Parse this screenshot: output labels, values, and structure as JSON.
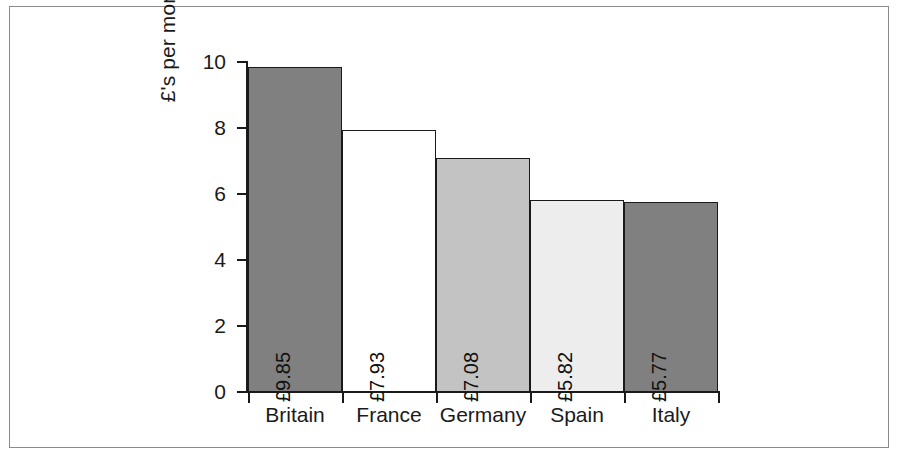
{
  "chart_data": {
    "type": "bar",
    "title": "",
    "subtitle": "",
    "xlabel": "",
    "ylabel": "£'s per month spent on toiletries",
    "categories": [
      "Britain",
      "France",
      "Germany",
      "Spain",
      "Italy"
    ],
    "values": [
      9.85,
      7.93,
      7.08,
      5.82,
      5.77
    ],
    "value_labels": [
      "£9.85",
      "£7.93",
      "£7.08",
      "£5.82",
      "£5.77"
    ],
    "bar_colors": [
      "#808080",
      "#ffffff",
      "#c3c3c3",
      "#ededed",
      "#808080"
    ],
    "bar_edge_color": "#1a1a1a",
    "ylim": [
      0,
      10
    ],
    "ytick_values": [
      10,
      8,
      6,
      4,
      2,
      0
    ],
    "ytick_labels": [
      "10",
      "8",
      "6",
      "4",
      "2",
      "0"
    ],
    "grid": false,
    "legend": null,
    "legend_position": "none",
    "value_label_rotation": -90,
    "ylabel_rotation": -90,
    "bar_gap": 0,
    "axis_color": "#1a1a1a",
    "background_color": "#ffffff",
    "frame_color": "#8b8b8b"
  }
}
